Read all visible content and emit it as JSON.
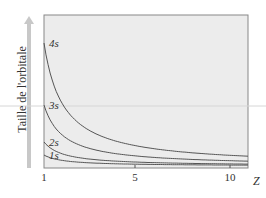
{
  "diagram": {
    "ylabel": "Taille de l'orbitale",
    "xlabel": "Z",
    "xticks": [
      "1",
      "5",
      "10"
    ],
    "curves": [
      {
        "label": "4s",
        "n": 4
      },
      {
        "label": "3s",
        "n": 3
      },
      {
        "label": "2s",
        "n": 2
      },
      {
        "label": "1s",
        "n": 1
      }
    ],
    "colors": {
      "plot_bg": "#ececec",
      "curve": "#555555",
      "arrow": "#c8c8c8",
      "frame": "#888888"
    }
  }
}
